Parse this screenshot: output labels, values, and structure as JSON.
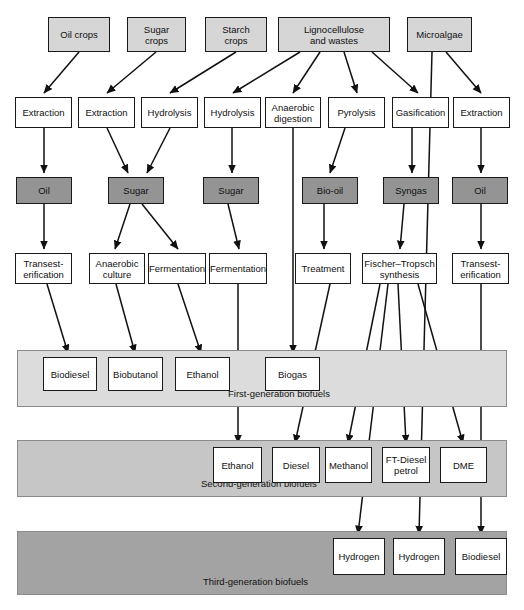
{
  "diagram": {
    "colors": {
      "feedstock_fill": "#d6d6d6",
      "process_fill": "#ffffff",
      "intermediate_fill": "#949494",
      "band_first": "#dcdcdc",
      "band_second": "#c6c6c6",
      "band_third": "#a3a3a3",
      "stroke": "#1a1a1a"
    },
    "feedstocks": [
      {
        "id": "oil-crops",
        "label": "Oil crops",
        "x": 48,
        "y": 17,
        "w": 62,
        "h": 35
      },
      {
        "id": "sugar-crops",
        "label": "Sugar\ncrops",
        "x": 127,
        "y": 17,
        "w": 59,
        "h": 35
      },
      {
        "id": "starch-crops",
        "label": "Starch\ncrops",
        "x": 205,
        "y": 17,
        "w": 62,
        "h": 35
      },
      {
        "id": "lignocellulose",
        "label": "Lignocellulose\nand wastes",
        "x": 278,
        "y": 17,
        "w": 112,
        "h": 35
      },
      {
        "id": "microalgae",
        "label": "Microalgae",
        "x": 407,
        "y": 17,
        "w": 65,
        "h": 35
      }
    ],
    "processes_row1": [
      {
        "id": "extraction-1",
        "label": "Extraction",
        "x": 15,
        "y": 97,
        "w": 57,
        "h": 31
      },
      {
        "id": "extraction-2",
        "label": "Extraction",
        "x": 78,
        "y": 97,
        "w": 57,
        "h": 31
      },
      {
        "id": "hydrolysis-1",
        "label": "Hydrolysis",
        "x": 141,
        "y": 97,
        "w": 57,
        "h": 31
      },
      {
        "id": "hydrolysis-2",
        "label": "Hydrolysis",
        "x": 204,
        "y": 97,
        "w": 57,
        "h": 31
      },
      {
        "id": "anaerobic-digestion",
        "label": "Anaerobic\ndigestion",
        "x": 265,
        "y": 97,
        "w": 56,
        "h": 31
      },
      {
        "id": "pyrolysis",
        "label": "Pyrolysis",
        "x": 328,
        "y": 97,
        "w": 57,
        "h": 31
      },
      {
        "id": "gasification",
        "label": "Gasification",
        "x": 392,
        "y": 97,
        "w": 57,
        "h": 31
      },
      {
        "id": "extraction-3",
        "label": "Extraction",
        "x": 453,
        "y": 97,
        "w": 57,
        "h": 31
      }
    ],
    "intermediates": [
      {
        "id": "oil-1",
        "label": "Oil",
        "x": 16,
        "y": 177,
        "w": 56,
        "h": 27
      },
      {
        "id": "sugar-1",
        "label": "Sugar",
        "x": 108,
        "y": 177,
        "w": 56,
        "h": 27
      },
      {
        "id": "sugar-2",
        "label": "Sugar",
        "x": 203,
        "y": 177,
        "w": 56,
        "h": 27
      },
      {
        "id": "bio-oil",
        "label": "Bio-oil",
        "x": 302,
        "y": 177,
        "w": 56,
        "h": 27
      },
      {
        "id": "syngas",
        "label": "Syngas",
        "x": 383,
        "y": 177,
        "w": 56,
        "h": 27
      },
      {
        "id": "oil-2",
        "label": "Oil",
        "x": 452,
        "y": 177,
        "w": 56,
        "h": 27
      }
    ],
    "processes_row2": [
      {
        "id": "transesterification-1",
        "label": "Transest-\nerification",
        "x": 15,
        "y": 253,
        "w": 57,
        "h": 31
      },
      {
        "id": "anaerobic-culture",
        "label": "Anaerobic\nculture",
        "x": 89,
        "y": 253,
        "w": 56,
        "h": 31
      },
      {
        "id": "fermentation-1",
        "label": "Fermentation",
        "x": 148,
        "y": 253,
        "w": 58,
        "h": 31
      },
      {
        "id": "fermentation-2",
        "label": "Fermentation",
        "x": 209,
        "y": 253,
        "w": 58,
        "h": 31
      },
      {
        "id": "treatment",
        "label": "Treatment",
        "x": 295,
        "y": 253,
        "w": 56,
        "h": 31
      },
      {
        "id": "fischer-tropsch",
        "label": "Fischer–Tropsch\nsynthesis",
        "x": 362,
        "y": 253,
        "w": 75,
        "h": 31
      },
      {
        "id": "transesterification-2",
        "label": "Transest-\nerification",
        "x": 452,
        "y": 253,
        "w": 57,
        "h": 31
      }
    ],
    "bands": [
      {
        "id": "first-generation",
        "label": "First-generation biofuels",
        "x": 17,
        "y": 350,
        "w": 490,
        "h": 57,
        "label_x": 228,
        "label_y": 388,
        "fill": "#dcdcdc",
        "products": [
          {
            "id": "biodiesel-1g",
            "label": "Biodiesel",
            "x": 43,
            "y": 357,
            "w": 54,
            "h": 34
          },
          {
            "id": "biobutanol-1g",
            "label": "Biobutanol",
            "x": 108,
            "y": 357,
            "w": 55,
            "h": 34
          },
          {
            "id": "ethanol-1g",
            "label": "Ethanol",
            "x": 175,
            "y": 357,
            "w": 55,
            "h": 34
          },
          {
            "id": "biogas-1g",
            "label": "Biogas",
            "x": 265,
            "y": 357,
            "w": 55,
            "h": 34
          }
        ]
      },
      {
        "id": "second-generation",
        "label": "Second-generation biofuels",
        "x": 17,
        "y": 440,
        "w": 490,
        "h": 57,
        "label_x": 201,
        "label_y": 478,
        "fill": "#c6c6c6",
        "products": [
          {
            "id": "ethanol-2g",
            "label": "Ethanol",
            "x": 213,
            "y": 447,
            "w": 49,
            "h": 36
          },
          {
            "id": "diesel-2g",
            "label": "Diesel",
            "x": 272,
            "y": 447,
            "w": 48,
            "h": 36
          },
          {
            "id": "methanol-2g",
            "label": "Methanol",
            "x": 325,
            "y": 447,
            "w": 47,
            "h": 36
          },
          {
            "id": "ft-diesel-petrol-2g",
            "label": "FT-Diesel\npetrol",
            "x": 382,
            "y": 447,
            "w": 48,
            "h": 36
          },
          {
            "id": "dme-2g",
            "label": "DME",
            "x": 440,
            "y": 447,
            "w": 47,
            "h": 36
          }
        ]
      },
      {
        "id": "third-generation",
        "label": "Third-generation biofuels",
        "x": 17,
        "y": 531,
        "w": 490,
        "h": 64,
        "label_x": 203,
        "label_y": 576,
        "fill": "#a3a3a3",
        "products": [
          {
            "id": "hydrogen-3g-1",
            "label": "Hydrogen",
            "x": 333,
            "y": 538,
            "w": 52,
            "h": 37
          },
          {
            "id": "hydrogen-3g-2",
            "label": "Hydrogen",
            "x": 393,
            "y": 538,
            "w": 52,
            "h": 37
          },
          {
            "id": "biodiesel-3g",
            "label": "Biodiesel",
            "x": 455,
            "y": 538,
            "w": 52,
            "h": 37
          }
        ]
      }
    ],
    "connections": [
      {
        "from": "oil-crops",
        "to": "extraction-1",
        "points": "79,52 44,93",
        "arrow": true
      },
      {
        "from": "sugar-crops",
        "to": "extraction-2",
        "points": "156,52 107,93",
        "arrow": true
      },
      {
        "from": "starch-crops",
        "to": "hydrolysis-1",
        "points": "236,52 170,93",
        "arrow": true
      },
      {
        "from": "lignocellulose",
        "to": "hydrolysis-2",
        "points": "300,52 233,93",
        "arrow": true
      },
      {
        "from": "lignocellulose",
        "to": "anaerobic-digestion",
        "points": "320,52 293,93",
        "arrow": true
      },
      {
        "from": "lignocellulose",
        "to": "pyrolysis",
        "points": "344,52 357,93",
        "arrow": true
      },
      {
        "from": "lignocellulose",
        "to": "gasification",
        "points": "372,52 418,93",
        "arrow": true
      },
      {
        "from": "microalgae",
        "to": "extraction-3",
        "points": "446,52 481,93",
        "arrow": true
      },
      {
        "from": "microalgae",
        "to": "hydrogen-3g-2",
        "points": "432,52 419,534",
        "arrow": true
      },
      {
        "from": "extraction-1",
        "to": "oil-1",
        "points": "44,128 44,173",
        "arrow": true
      },
      {
        "from": "extraction-2",
        "to": "sugar-1",
        "points": "107,128 128,173",
        "arrow": true
      },
      {
        "from": "hydrolysis-1",
        "to": "sugar-1",
        "points": "170,128 147,173",
        "arrow": true
      },
      {
        "from": "hydrolysis-2",
        "to": "sugar-2",
        "points": "232,128 232,173",
        "arrow": true
      },
      {
        "from": "anaerobic-digestion",
        "to": "biogas-1g",
        "points": "293,128 293,353",
        "arrow": true
      },
      {
        "from": "pyrolysis",
        "to": "bio-oil",
        "points": "345,128 330,173",
        "arrow": true
      },
      {
        "from": "gasification",
        "to": "syngas",
        "points": "412,128 412,173",
        "arrow": true
      },
      {
        "from": "extraction-3",
        "to": "oil-2",
        "points": "481,128 481,173",
        "arrow": true
      },
      {
        "from": "oil-1",
        "to": "transesterification-1",
        "points": "44,204 44,249",
        "arrow": true
      },
      {
        "from": "sugar-1",
        "to": "anaerobic-culture",
        "points": "130,204 115,249",
        "arrow": true
      },
      {
        "from": "sugar-1",
        "to": "fermentation-1",
        "points": "142,204 178,249",
        "arrow": true
      },
      {
        "from": "sugar-2",
        "to": "fermentation-2",
        "points": "228,204 239,249",
        "arrow": true
      },
      {
        "from": "bio-oil",
        "to": "treatment",
        "points": "324,204 324,249",
        "arrow": true
      },
      {
        "from": "syngas",
        "to": "fischer-tropsch",
        "points": "404,204 400,249",
        "arrow": true
      },
      {
        "from": "oil-2",
        "to": "transesterification-2",
        "points": "481,204 481,249",
        "arrow": true
      },
      {
        "from": "transesterification-1",
        "to": "biodiesel-1g",
        "points": "47,284 68,353",
        "arrow": true
      },
      {
        "from": "anaerobic-culture",
        "to": "biobutanol-1g",
        "points": "116,284 135,353",
        "arrow": true
      },
      {
        "from": "fermentation-1",
        "to": "ethanol-1g",
        "points": "178,284 201,353",
        "arrow": true
      },
      {
        "from": "fermentation-2",
        "to": "ethanol-2g",
        "points": "238,284 238,443",
        "arrow": true
      },
      {
        "from": "treatment",
        "to": "diesel-2g",
        "points": "330,284 295,443",
        "arrow": true
      },
      {
        "from": "fischer-tropsch",
        "to": "methanol-2g",
        "points": "380,284 348,443",
        "arrow": true
      },
      {
        "from": "fischer-tropsch",
        "to": "ft-diesel-petrol-2g",
        "points": "398,284 406,443",
        "arrow": true
      },
      {
        "from": "fischer-tropsch",
        "to": "dme-2g",
        "points": "418,284 463,443",
        "arrow": true
      },
      {
        "from": "fischer-tropsch",
        "to": "hydrogen-3g-1",
        "points": "388,284 358,534",
        "arrow": true
      },
      {
        "from": "transesterification-2",
        "to": "biodiesel-3g",
        "points": "481,284 481,534",
        "arrow": true
      }
    ]
  }
}
